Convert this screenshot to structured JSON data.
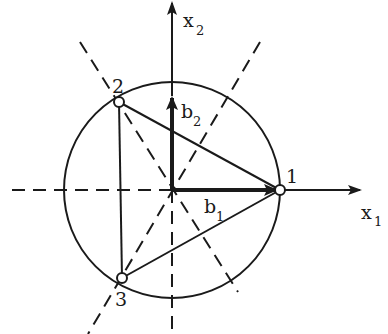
{
  "diagram": {
    "type": "lattice-basis-geometry",
    "axes": {
      "x1": {
        "label": "x",
        "subscript": "1"
      },
      "x2": {
        "label": "x",
        "subscript": "2"
      }
    },
    "vectors": {
      "b1": {
        "label": "b",
        "subscript": "1"
      },
      "b2": {
        "label": "b",
        "subscript": "2"
      }
    },
    "points": [
      {
        "id": "1",
        "label": "1"
      },
      {
        "id": "2",
        "label": "2"
      },
      {
        "id": "3",
        "label": "3"
      }
    ],
    "colors": {
      "ink": "#1a1a1a",
      "background": "#ffffff"
    }
  }
}
